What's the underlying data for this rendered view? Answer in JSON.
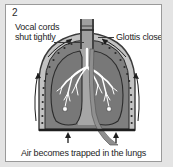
{
  "figure": {
    "panel_number": "2",
    "labels": {
      "left_line1": "Vocal cords",
      "left_line2": "shut tightly",
      "right": "Glottis closes"
    },
    "caption": "Air becomes trapped in the lungs",
    "colors": {
      "background": "#e4e4e4",
      "panel_background": "#ffffff",
      "frame_border": "#9a9a9a",
      "text": "#1e1e1e",
      "lung_tissue": "#8a8a8a",
      "lung_tissue_dark": "#6e6e6e",
      "chest_wall": "#b4b4b4",
      "mediastinum": "#a8a8a8",
      "airway": "#9e9e9e",
      "outline": "#2b2b2b",
      "bronchi": "#ffffff",
      "arrow": "#1e1e1e",
      "diaphragm": "#1e1e1e"
    },
    "anatomy": [
      "trachea",
      "closed-glottis",
      "left-lung",
      "right-lung",
      "bronchial-tree",
      "chest-wall-ribs",
      "diaphragm",
      "mediastinum",
      "descending-aorta"
    ],
    "arrows": {
      "chest_wall_count": 4,
      "diaphragm_count": 2,
      "direction": "outward-and-upward"
    }
  }
}
